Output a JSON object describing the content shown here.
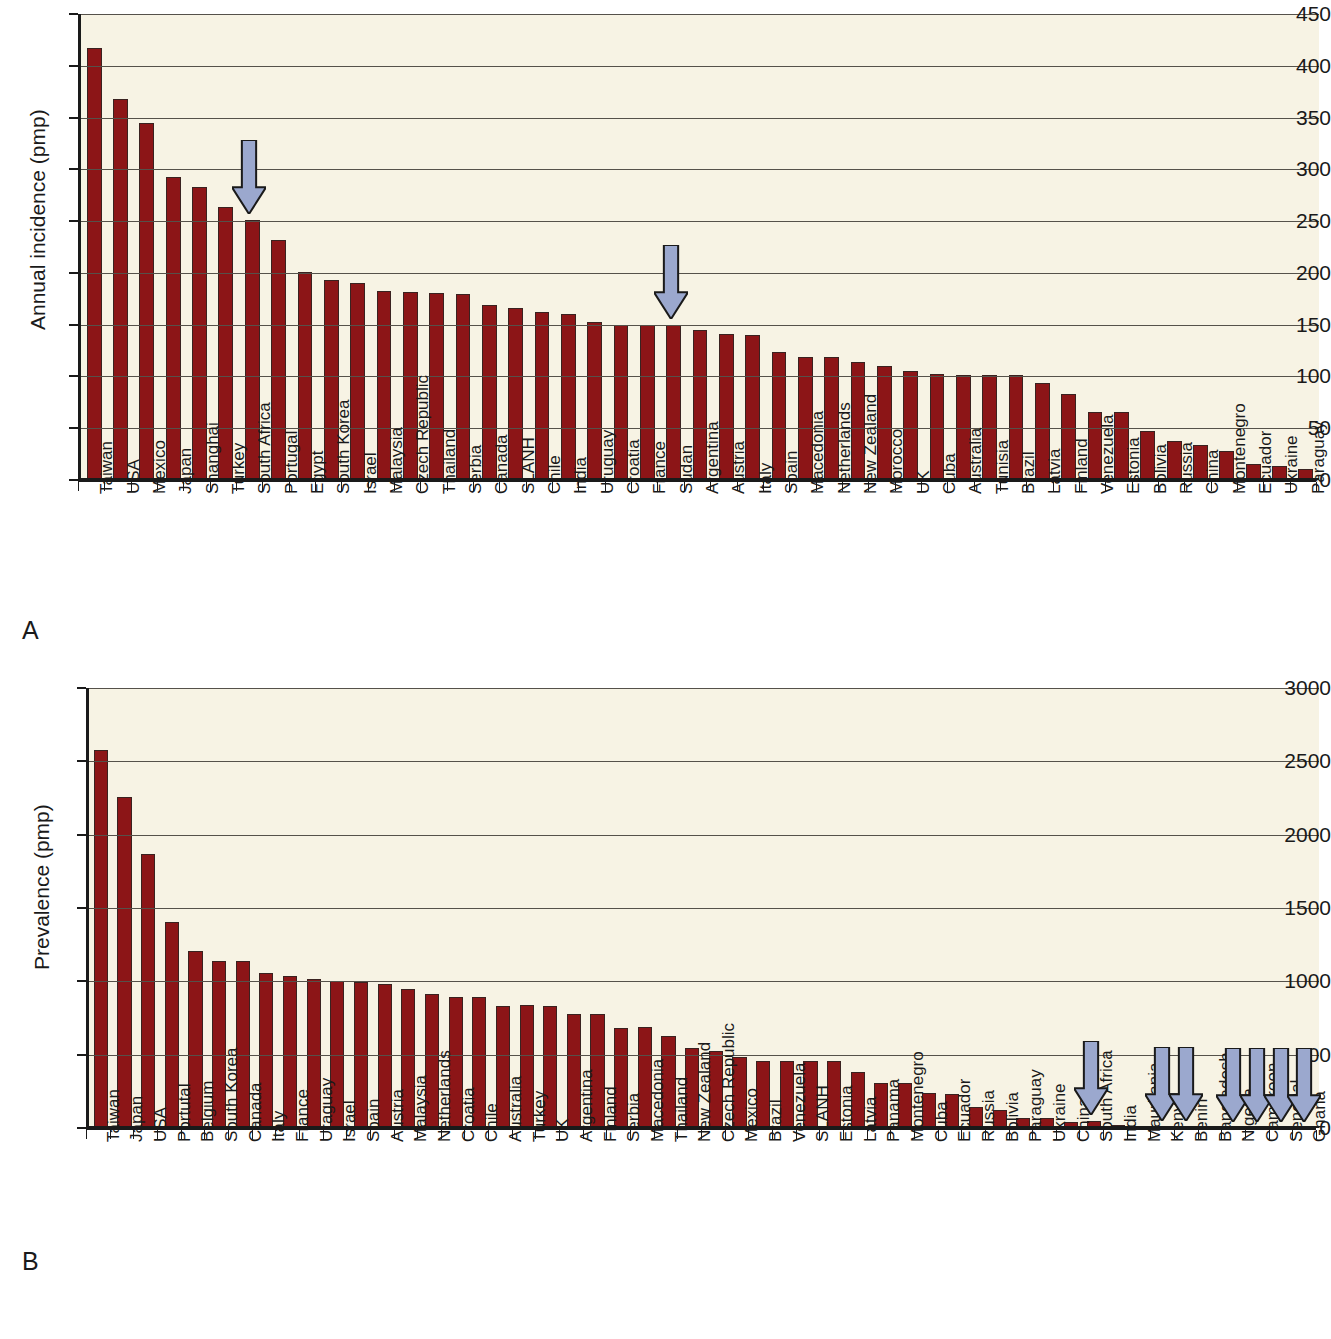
{
  "figure": {
    "panels": [
      {
        "letter": "A"
      },
      {
        "letter": "B"
      }
    ],
    "colors": {
      "bar": "#8c1517",
      "bar_outline": "#3a2220",
      "plot_background": "#f7f3e4",
      "arrow_fill": "#9ba8ce",
      "arrow_outline": "#1a1a1a",
      "gridline": "#55514a",
      "axis": "#1a1a1a"
    }
  },
  "chart_data": [
    {
      "type": "bar",
      "panel": "A",
      "title": "",
      "xlabel": "",
      "ylabel": "Annual incidence (pmp)",
      "ylim": [
        0,
        450
      ],
      "yticks": [
        0,
        50,
        100,
        150,
        200,
        250,
        300,
        350,
        400,
        450
      ],
      "grid": true,
      "legend": "none",
      "categories": [
        "Taiwan",
        "USA",
        "Mexico",
        "Japan",
        "Shanghai",
        "Turkey",
        "South Africa",
        "Portugal",
        "Egypt",
        "South Korea",
        "Israel",
        "Malaysia",
        "Czech Republic",
        "Thailand",
        "Serbia",
        "Canada",
        "SLANH",
        "Chile",
        "India",
        "Uruguay",
        "Croatia",
        "France",
        "Sudan",
        "Argentina",
        "Austria",
        "Italy",
        "Spain",
        "Macedonia",
        "Netherlands",
        "New Zealand",
        "Morocco",
        "UK",
        "Cuba",
        "Australia",
        "Tunisia",
        "Brazil",
        "Latvia",
        "Finland",
        "Venezuela",
        "Estonia",
        "Bolivia",
        "Russia",
        "China",
        "Montenegro",
        "Ecuador",
        "Ukraine",
        "Paraguay"
      ],
      "values": [
        417,
        368,
        345,
        293,
        283,
        264,
        251,
        232,
        201,
        193,
        190,
        183,
        182,
        181,
        180,
        169,
        166,
        162,
        160,
        153,
        150,
        150,
        150,
        145,
        141,
        140,
        124,
        119,
        119,
        114,
        110,
        105,
        102,
        101,
        101,
        101,
        94,
        83,
        66,
        66,
        47,
        38,
        34,
        28,
        15,
        14,
        11
      ],
      "annotations": [
        {
          "type": "arrow",
          "points_to": "South Africa",
          "value": 251
        },
        {
          "type": "arrow",
          "points_to": "Sudan",
          "value": 150
        }
      ]
    },
    {
      "type": "bar",
      "panel": "B",
      "title": "",
      "xlabel": "",
      "ylabel": "Prevalence (pmp)",
      "ylim": [
        0,
        3000
      ],
      "yticks": [
        0,
        500,
        1000,
        1500,
        2000,
        2500,
        3000
      ],
      "grid": true,
      "legend": "none",
      "categories": [
        "Taiwan",
        "Japan",
        "USA",
        "Portutal",
        "Belgium",
        "South Korea",
        "Canada",
        "Italy",
        "France",
        "Uraguay",
        "Israel",
        "Spain",
        "Austria",
        "Malaysia",
        "Netherlands",
        "Croatia",
        "Chile",
        "Australia",
        "Turkey",
        "UK",
        "Argentina",
        "Finland",
        "Serbia",
        "Macedonia",
        "Thailand",
        "New Zealand",
        "Czech Republic",
        "Mexico",
        "Brazil",
        "Venezuela",
        "SLANH",
        "Estonia",
        "Latvia",
        "Panama",
        "Montenegro",
        "Cuba",
        "Ecuador",
        "Russia",
        "Bolivia",
        "Paraguay",
        "Ukraine",
        "China",
        "South Africa",
        "India",
        "Mauritania",
        "Kenya",
        "Benin",
        "Bangladesh",
        "Nigeria",
        "Cameroon",
        "Senegal",
        "Ghana"
      ],
      "values": [
        2580,
        2255,
        1870,
        1405,
        1205,
        1140,
        1140,
        1055,
        1035,
        1015,
        1000,
        995,
        985,
        950,
        915,
        895,
        895,
        830,
        840,
        830,
        780,
        780,
        685,
        690,
        630,
        545,
        525,
        485,
        460,
        455,
        455,
        455,
        385,
        305,
        305,
        240,
        230,
        140,
        120,
        65,
        65,
        40,
        45,
        18,
        12,
        7,
        5,
        4,
        3,
        3,
        3,
        3
      ],
      "annotations": [
        {
          "type": "arrow",
          "points_to": "South Africa",
          "value": 45
        },
        {
          "type": "arrow",
          "points_to": "Kenya",
          "value": 7
        },
        {
          "type": "arrow",
          "points_to": "Benin",
          "value": 5
        },
        {
          "type": "arrow",
          "points_to": "Nigeria",
          "value": 3
        },
        {
          "type": "arrow",
          "points_to": "Cameroon",
          "value": 3
        },
        {
          "type": "arrow",
          "points_to": "Senegal",
          "value": 3
        },
        {
          "type": "arrow",
          "points_to": "Ghana",
          "value": 3
        }
      ]
    }
  ]
}
